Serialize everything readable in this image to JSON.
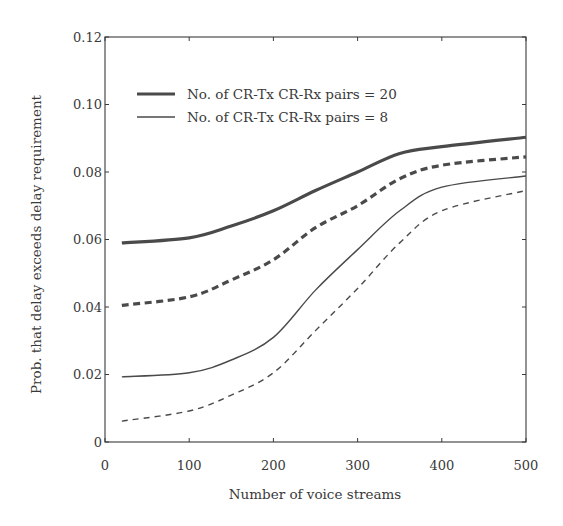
{
  "chart_data": {
    "type": "line",
    "title": "",
    "xlabel": "Number of voice streams",
    "ylabel": "Prob. that delay exceeds delay requirement",
    "xlim": [
      0,
      500
    ],
    "ylim": [
      0,
      0.12
    ],
    "xticks": [
      0,
      100,
      200,
      300,
      400,
      500
    ],
    "xtick_labels": [
      "0",
      "100",
      "200",
      "300",
      "400",
      "500"
    ],
    "yticks": [
      0,
      0.02,
      0.04,
      0.06,
      0.08,
      0.1,
      0.12
    ],
    "ytick_labels": [
      "0",
      "0.02",
      "0.04",
      "0.06",
      "0.08",
      "0.10",
      "0.12"
    ],
    "grid": false,
    "legend_position": "upper left",
    "legend": [
      {
        "label": "No. of CR-Tx CR-Rx pairs = 20",
        "style": "thick-solid"
      },
      {
        "label": "No. of CR-Tx CR-Rx pairs = 8",
        "style": "thin-solid"
      }
    ],
    "x": [
      20,
      100,
      150,
      200,
      250,
      300,
      350,
      400,
      500
    ],
    "series": [
      {
        "name": "pairs = 20 (solid)",
        "linewidth": 3.2,
        "dashed": false,
        "values": [
          0.059,
          0.0605,
          0.064,
          0.0685,
          0.0745,
          0.08,
          0.0855,
          0.0875,
          0.0903
        ]
      },
      {
        "name": "pairs = 20 (dashed)",
        "linewidth": 3.2,
        "dashed": true,
        "values": [
          0.0405,
          0.043,
          0.048,
          0.054,
          0.0635,
          0.07,
          0.078,
          0.082,
          0.0845
        ]
      },
      {
        "name": "pairs = 8 (solid)",
        "linewidth": 1.4,
        "dashed": false,
        "values": [
          0.0193,
          0.0205,
          0.0243,
          0.031,
          0.045,
          0.057,
          0.0685,
          0.0755,
          0.0788
        ]
      },
      {
        "name": "pairs = 8 (dashed)",
        "linewidth": 1.4,
        "dashed": true,
        "values": [
          0.0062,
          0.0092,
          0.0139,
          0.0205,
          0.033,
          0.0455,
          0.059,
          0.0685,
          0.0745
        ]
      }
    ]
  },
  "colors": {
    "line": "#4a4a4a",
    "axis": "#3a3a3a",
    "text": "#3a3a3a",
    "background": "#ffffff"
  }
}
